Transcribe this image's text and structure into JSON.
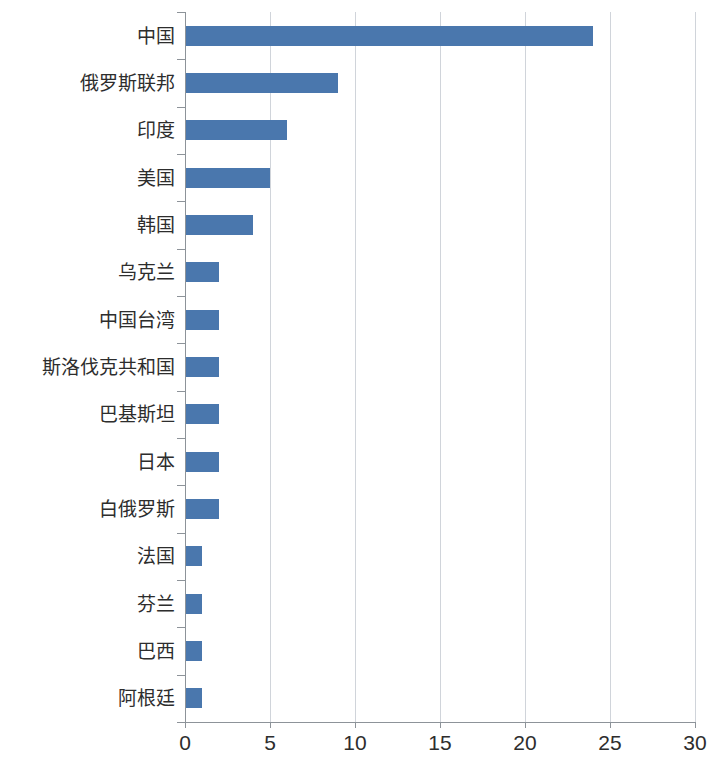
{
  "chart_data": {
    "type": "bar",
    "orientation": "horizontal",
    "title": "",
    "subtitle": "",
    "xlabel": "",
    "ylabel": "",
    "xlim": [
      0,
      30
    ],
    "xticks": [
      0,
      5,
      10,
      15,
      20,
      25,
      30
    ],
    "xtick_labels": [
      "0",
      "5",
      "10",
      "15",
      "20",
      "25",
      "30"
    ],
    "grid": "vertical",
    "legend": "none",
    "bar_color": "#4a77ad",
    "gridline_color": "#d0d4da",
    "axis_color": "#8d9399",
    "categories": [
      "中国",
      "俄罗斯联邦",
      "印度",
      "美国",
      "韩国",
      "乌克兰",
      "中国台湾",
      "斯洛伐克共和国",
      "巴基斯坦",
      "日本",
      "白俄罗斯",
      "法国",
      "芬兰",
      "巴西",
      "阿根廷"
    ],
    "values": [
      24,
      9,
      6,
      5,
      4,
      2,
      2,
      2,
      2,
      2,
      2,
      1,
      1,
      1,
      1
    ],
    "series": [
      {
        "name": "",
        "values": [
          24,
          9,
          6,
          5,
          4,
          2,
          2,
          2,
          2,
          2,
          2,
          1,
          1,
          1,
          1
        ]
      }
    ]
  }
}
